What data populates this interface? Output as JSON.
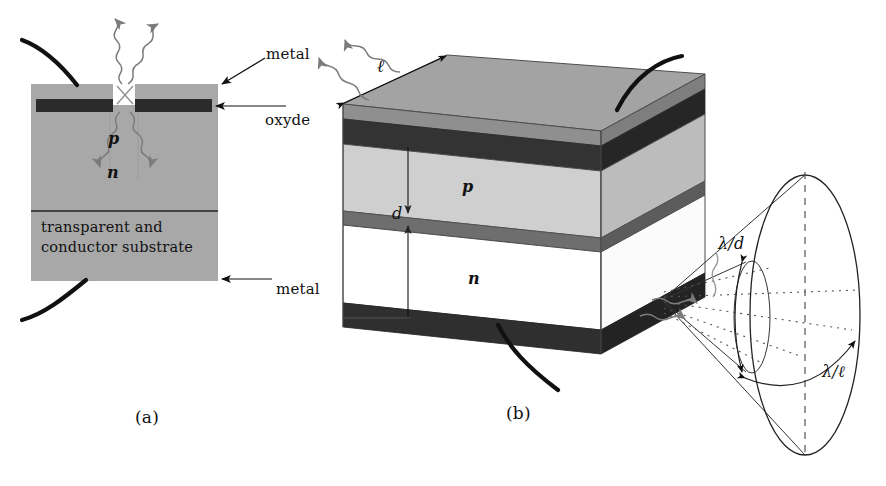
{
  "figure": {
    "background_color": "#ffffff",
    "ink_color": "#111111",
    "panels": [
      {
        "id": "a",
        "caption": "(a)",
        "caption_x": 135,
        "caption_y": 408,
        "description": "Cross-section of a surface-emitting diode with oxide aperture on a transparent conducting substrate"
      },
      {
        "id": "b",
        "caption": "(b)",
        "caption_x": 506,
        "caption_y": 404,
        "description": "Perspective view of an edge-emitting stripe laser with elliptical far-field emission pattern"
      }
    ]
  },
  "panel_a": {
    "labels": {
      "metal_top": "metal",
      "oxyde": "oxyde",
      "metal_bottom": "metal",
      "p_layer": "p",
      "n_layer": "n",
      "substrate_line1": "transparent and",
      "substrate_line2": "conductor substrate"
    },
    "geometry": {
      "body_x": 31,
      "body_y": 84,
      "body_w": 187,
      "body_h": 197,
      "aperture_x": 113,
      "aperture_w": 22,
      "aperture_h": 21,
      "oxide_y": 99,
      "oxide_h": 13,
      "oxide_left_x": 36,
      "oxide_left_w": 76,
      "oxide_right_x": 136,
      "oxide_right_w": 76,
      "substrate_divider_y": 211
    },
    "colors": {
      "body_fill": "#a8a8a8",
      "oxide_fill": "#2b2b2b",
      "aperture_fill": "#ffffff",
      "outline": "#555555"
    }
  },
  "panel_b": {
    "labels": {
      "cavity_length": "ℓ",
      "active_thickness": "d",
      "p_layer": "p",
      "n_layer": "n",
      "vertical_divergence": "λ/d",
      "horizontal_divergence": "λ/ℓ"
    },
    "colors": {
      "top_metal_fill": "#a3a3a3",
      "top_metal_side": "#8f8f8f",
      "dark_contact_fill": "#3a3a3a",
      "dark_contact_side": "#2a2a2a",
      "p_layer_fill": "#cfcfcf",
      "p_layer_side": "#bcbcbc",
      "active_stripe_fill": "#6e6e6e",
      "active_stripe_side": "#5c5c5c",
      "n_layer_fill": "#ffffff",
      "n_layer_side": "#f2f2f2",
      "bottom_contact_fill": "#2f2f2f",
      "outline": "#4d4d4d"
    },
    "emission": {
      "ellipse_cx": 805,
      "ellipse_cy": 315,
      "ellipse_rx": 55,
      "ellipse_ry": 140,
      "apex_x": 662,
      "apex_y": 300,
      "axis_style": "dashed"
    }
  },
  "photons": {
    "panel_a_out": 2,
    "panel_a_in": 2,
    "panel_b_out": 2,
    "panel_b_emission": 3,
    "style": "wavy-arrow",
    "color": "#6e6e6e"
  }
}
